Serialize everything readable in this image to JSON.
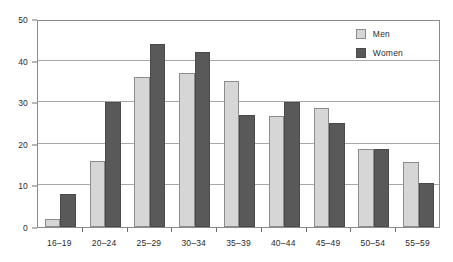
{
  "chart_data": {
    "type": "bar",
    "title": "",
    "subtitle": "",
    "xlabel": "",
    "ylabel": "",
    "ylim": [
      0,
      50
    ],
    "y_ticks": [
      0,
      10,
      20,
      30,
      40,
      50
    ],
    "grid": true,
    "legend_position": "top-right",
    "categories": [
      "16–19",
      "20–24",
      "25–29",
      "30–34",
      "35–39",
      "40–44",
      "45–49",
      "50–54",
      "55–59"
    ],
    "series": [
      {
        "name": "Men",
        "color": "#d6d6d6",
        "values": [
          2,
          15.8,
          36,
          37,
          35,
          26.8,
          28.7,
          18.8,
          15.6
        ]
      },
      {
        "name": "Women",
        "color": "#595959",
        "values": [
          8,
          30,
          44,
          42,
          27,
          30,
          25,
          18.8,
          10.7
        ]
      }
    ]
  },
  "legend": {
    "items": [
      {
        "label": "Men",
        "swatch": "men-swatch"
      },
      {
        "label": "Women",
        "swatch": "women-swatch"
      }
    ]
  }
}
